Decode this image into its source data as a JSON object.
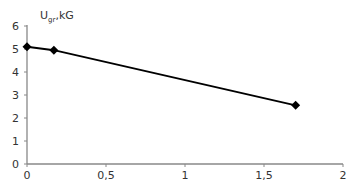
{
  "chart_data": {
    "type": "line",
    "title": "",
    "xlabel": "",
    "ylabel": "U",
    "ylabel_sub": "gr",
    "ylabel_unit": ",kG",
    "x": [
      0,
      0.17,
      1.7
    ],
    "series": [
      {
        "name": "U_gr",
        "values": [
          5.1,
          4.95,
          2.55
        ],
        "color": "#000000",
        "marker": "diamond"
      }
    ],
    "xlim": [
      0,
      2
    ],
    "ylim": [
      0,
      6
    ],
    "x_ticks": [
      0,
      0.5,
      1,
      1.5,
      2
    ],
    "x_tick_labels": [
      "0",
      "0,5",
      "1",
      "1,5",
      "2"
    ],
    "y_ticks": [
      0,
      1,
      2,
      3,
      4,
      5,
      6
    ],
    "y_tick_labels": [
      "0",
      "1",
      "2",
      "3",
      "4",
      "5",
      "6"
    ],
    "grid": false,
    "legend": false
  }
}
